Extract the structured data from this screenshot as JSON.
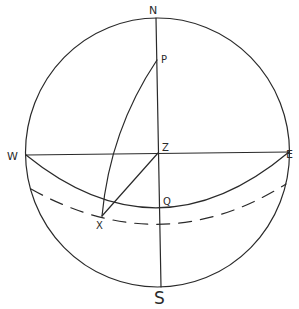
{
  "figure": {
    "type": "celestial-sphere-diagram",
    "stroke_color": "#2a2a2a",
    "background": "#ffffff"
  },
  "labels": {
    "N": "N",
    "S": "S",
    "E": "E",
    "W": "W",
    "Z": "Z",
    "P": "P",
    "Q": "Q",
    "X": "X"
  },
  "points": {
    "N": [
      156,
      18
    ],
    "S": [
      161,
      287
    ],
    "W": [
      26,
      155
    ],
    "E": [
      289,
      152
    ],
    "Z": [
      158,
      153
    ],
    "P": [
      157,
      60
    ],
    "Q": [
      159,
      207
    ],
    "X": [
      102,
      216
    ]
  },
  "elements": {
    "outer_circle": {
      "cx": 157,
      "cy": 152,
      "rx": 133,
      "ry": 135
    },
    "meridian_NS": "straight line N to S",
    "horizon_line_WE": "straight line W to E through Z",
    "equator_arc": "arc W through Q to E",
    "dashed_arc": "dashed parallel arc through X",
    "arc_PX": "curved arc from P to X",
    "line_ZX": "straight line Z to X"
  }
}
